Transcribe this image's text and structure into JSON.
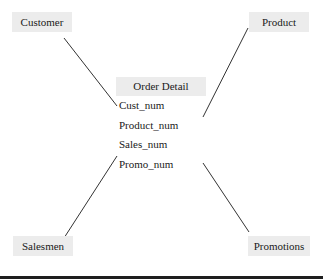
{
  "diagram": {
    "type": "star-schema",
    "fact_table": {
      "title": "Order Detail",
      "fields": [
        "Cust_num",
        "Product_num",
        "Sales_num",
        "Promo_num"
      ]
    },
    "dimensions": [
      {
        "name": "Customer",
        "position": "top-left",
        "links_to": "Cust_num"
      },
      {
        "name": "Product",
        "position": "top-right",
        "links_to": "Product_num"
      },
      {
        "name": "Salesmen",
        "position": "bottom-left",
        "links_to": "Sales_num"
      },
      {
        "name": "Promotions",
        "position": "bottom-right",
        "links_to": "Promo_num"
      }
    ],
    "colors": {
      "box_fill": "#ececec",
      "line": "#333333",
      "text": "#1a1a1a",
      "bottom_rule": "#1e1e1e"
    }
  }
}
